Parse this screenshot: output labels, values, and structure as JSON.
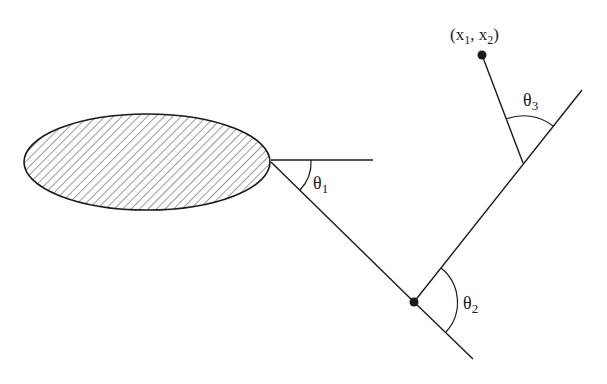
{
  "diagram": {
    "colors": {
      "stroke": "#1a1a1a",
      "hatch": "#555555",
      "background": "#ffffff"
    },
    "base": {
      "shape": "hatched-ellipse",
      "cx": 147,
      "cy": 162,
      "rx": 123,
      "ry": 48
    },
    "joints": [
      {
        "name": "shoulder",
        "x": 271,
        "y": 162
      },
      {
        "name": "elbow",
        "x": 414,
        "y": 302
      },
      {
        "name": "wrist",
        "x": 523,
        "y": 163
      },
      {
        "name": "end-effector",
        "x": 482,
        "y": 55
      }
    ],
    "labels": {
      "target_point": "(x",
      "target_sub1": "1",
      "target_mid": ", x",
      "target_sub2": "2",
      "target_close": ")",
      "theta1": "θ",
      "theta1_sub": "1",
      "theta2": "θ",
      "theta2_sub": "2",
      "theta3": "θ",
      "theta3_sub": "3"
    }
  }
}
